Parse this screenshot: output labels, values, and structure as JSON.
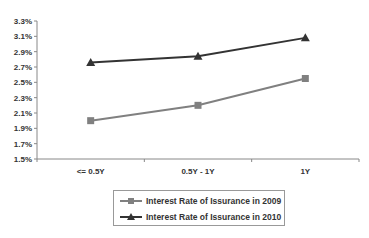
{
  "chart_data": {
    "type": "line",
    "title": "",
    "xlabel": "",
    "ylabel": "",
    "categories": [
      "<= 0.5Y",
      "0.5Y - 1Y",
      "1Y"
    ],
    "series": [
      {
        "name": "Interest Rate of Issurance in 2009",
        "values": [
          2.0,
          2.2,
          2.55
        ],
        "marker": "square",
        "color": "#808080"
      },
      {
        "name": "Interest Rate of Issurance in 2010",
        "values": [
          2.76,
          2.84,
          3.08
        ],
        "marker": "triangle",
        "color": "#333333"
      }
    ],
    "ylim": [
      1.5,
      3.3
    ],
    "yticks": [
      "3.3%",
      "3.1%",
      "2.9%",
      "2.7%",
      "2.5%",
      "2.3%",
      "2.1%",
      "1.9%",
      "1.7%",
      "1.5%"
    ],
    "grid": false,
    "legend_position": "bottom"
  },
  "legend": {
    "items": [
      {
        "label": "Interest Rate of Issurance in 2009"
      },
      {
        "label": "Interest Rate of Issurance in 2010"
      }
    ]
  }
}
